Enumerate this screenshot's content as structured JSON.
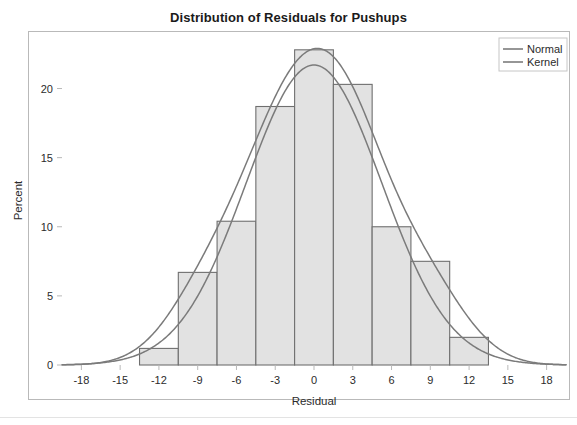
{
  "chart_data": {
    "type": "bar",
    "title": "Distribution of Residuals for Pushups",
    "xlabel": "Residual",
    "ylabel": "Percent",
    "xlim": [
      -19.5,
      19.5
    ],
    "ylim": [
      0,
      23.8
    ],
    "grid": false,
    "legend_position": "top-right",
    "x_ticks": [
      -18,
      -15,
      -12,
      -9,
      -6,
      -3,
      0,
      3,
      6,
      9,
      12,
      15,
      18
    ],
    "x_tick_labels": [
      "-18",
      "-15",
      "-12",
      "-9",
      "-6",
      "-3",
      "0",
      "3",
      "6",
      "9",
      "12",
      "15",
      "18"
    ],
    "y_ticks": [
      0,
      5,
      10,
      15,
      20
    ],
    "y_tick_labels": [
      "0",
      "5",
      "10",
      "15",
      "20"
    ],
    "bin_width": 3,
    "bars": [
      {
        "bin_start": -13.5,
        "bin_end": -10.5,
        "center": -12.0,
        "value": 1.2
      },
      {
        "bin_start": -10.5,
        "bin_end": -7.5,
        "center": -9.0,
        "value": 6.7
      },
      {
        "bin_start": -7.5,
        "bin_end": -4.5,
        "center": -6.0,
        "value": 10.4
      },
      {
        "bin_start": -4.5,
        "bin_end": -1.5,
        "center": -3.0,
        "value": 18.7
      },
      {
        "bin_start": -1.5,
        "bin_end": 1.5,
        "center": 0.0,
        "value": 22.8
      },
      {
        "bin_start": 1.5,
        "bin_end": 4.5,
        "center": 3.0,
        "value": 20.3
      },
      {
        "bin_start": 4.5,
        "bin_end": 7.5,
        "center": 6.0,
        "value": 10.0
      },
      {
        "bin_start": 7.5,
        "bin_end": 10.5,
        "center": 9.0,
        "value": 7.5
      },
      {
        "bin_start": 10.5,
        "bin_end": 13.5,
        "center": 12.0,
        "value": 2.0
      }
    ],
    "series": [
      {
        "name": "Normal",
        "kind": "line",
        "color": "#7b7b7b",
        "distribution": "normal",
        "mean": 0.0,
        "sigma": 5.25,
        "peak_percent": 21.7
      },
      {
        "name": "Kernel",
        "kind": "line",
        "color": "#7b7b7b",
        "distribution": "kernel",
        "peak_percent": 22.9,
        "peak_x": -0.6
      }
    ],
    "legend": [
      {
        "label": "Normal",
        "color": "#7b7b7b"
      },
      {
        "label": "Kernel",
        "color": "#7b7b7b"
      }
    ],
    "style": {
      "bar_fill": "#e2e2e2",
      "bar_stroke": "#6f6f6f",
      "axis_color": "#b9b9b9",
      "text_color": "#2b2b2b",
      "background": "#ffffff"
    }
  }
}
